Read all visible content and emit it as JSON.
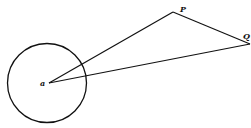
{
  "diagram": {
    "type": "geometry",
    "circle": {
      "center_label": "a",
      "cx": 47,
      "cy": 83,
      "r": 40
    },
    "points": {
      "a": {
        "label": "a",
        "x": 49,
        "y": 83
      },
      "P": {
        "label": "P",
        "x": 173,
        "y": 12
      },
      "Q": {
        "label": "Q",
        "x": 250,
        "y": 44
      }
    },
    "segments": [
      {
        "from": "a",
        "to": "P"
      },
      {
        "from": "P",
        "to": "Q"
      },
      {
        "from": "Q",
        "to": "a"
      }
    ],
    "stroke_color": "#111111",
    "background": "#ffffff"
  }
}
